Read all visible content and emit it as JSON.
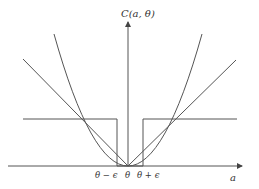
{
  "diagram": {
    "y_axis_label": "C(a, θ)",
    "x_axis_label": "a",
    "tick_labels": {
      "left": "θ − ϵ",
      "center": "θ",
      "right": "θ + ϵ"
    },
    "curves": [
      {
        "name": "quadratic-loss",
        "shape": "parabola"
      },
      {
        "name": "absolute-loss",
        "shape": "v-line"
      },
      {
        "name": "zero-one-loss",
        "shape": "step"
      }
    ],
    "colors": {
      "stroke": "#444444",
      "background": "#ffffff"
    }
  }
}
